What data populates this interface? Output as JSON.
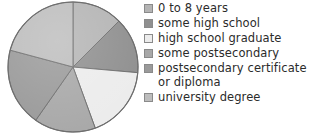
{
  "chart_data": {
    "type": "pie",
    "title": "",
    "legend_position": "right",
    "categories": [
      "0 to 8 years",
      "some high school",
      "high school graduate",
      "some postsecondary",
      "postsecondary certificate or diploma",
      "university degree"
    ],
    "values": [
      12.5,
      15.0,
      18.0,
      12.5,
      22.0,
      20.0
    ],
    "colors": [
      "#b4b4b4",
      "#8f8f8f",
      "#ececec",
      "#a8a8a8",
      "#9a9a9a",
      "#bdbdbd"
    ],
    "slice_start_angles_deg": [
      0,
      45,
      95,
      160,
      215,
      285
    ],
    "slice_end_angles_deg": [
      45,
      95,
      160,
      215,
      285,
      360
    ],
    "stroke_color": "#6e6e6e",
    "grid": false,
    "xlabel": "",
    "ylabel": ""
  },
  "legend": {
    "items": [
      {
        "label": "0 to 8 years",
        "color": "#b4b4b4",
        "swatch_name": "legend-swatch-0-to-8-years"
      },
      {
        "label": "some high school",
        "color": "#8f8f8f",
        "swatch_name": "legend-swatch-some-high-school"
      },
      {
        "label": "high school graduate",
        "color": "#ececec",
        "swatch_name": "legend-swatch-high-school-graduate"
      },
      {
        "label": "some postsecondary",
        "color": "#a8a8a8",
        "swatch_name": "legend-swatch-some-postsecondary"
      },
      {
        "label": "postsecondary certificate\nor diploma",
        "color": "#9a9a9a",
        "swatch_name": "legend-swatch-postsecondary-certificate"
      },
      {
        "label": "university degree",
        "color": "#bdbdbd",
        "swatch_name": "legend-swatch-university-degree"
      }
    ]
  }
}
